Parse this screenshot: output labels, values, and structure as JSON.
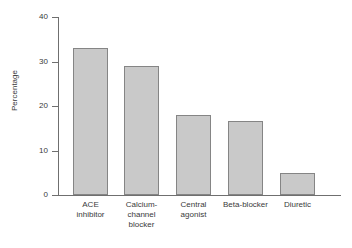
{
  "chart_data": {
    "type": "bar",
    "title": "",
    "subtitle": "",
    "xlabel": "",
    "ylabel": "Percentage",
    "categories": [
      "ACE inhibitor",
      "Calcium-channel blocker",
      "Central agonist",
      "Beta-blocker",
      "Diuretic"
    ],
    "category_lines": [
      [
        "ACE",
        "inhibitor"
      ],
      [
        "Calcium-",
        "channel",
        "blocker"
      ],
      [
        "Central",
        "agonist"
      ],
      [
        "Beta-blocker"
      ],
      [
        "Diuretic"
      ]
    ],
    "values": [
      33,
      29,
      18,
      16.6,
      5
    ],
    "ylim": [
      0,
      40
    ],
    "yticks": [
      0,
      10,
      20,
      30,
      40
    ],
    "ytick_labels": [
      "0",
      "10",
      "20",
      "30",
      "40"
    ],
    "grid": false,
    "legend": false,
    "legend_position": "none",
    "bar_fill_color": "#c9c9c9",
    "bar_border_color": "#858585",
    "axis_color": "#6f6f6f",
    "text_color": "#3a3a3a",
    "background_color": "#ffffff"
  }
}
